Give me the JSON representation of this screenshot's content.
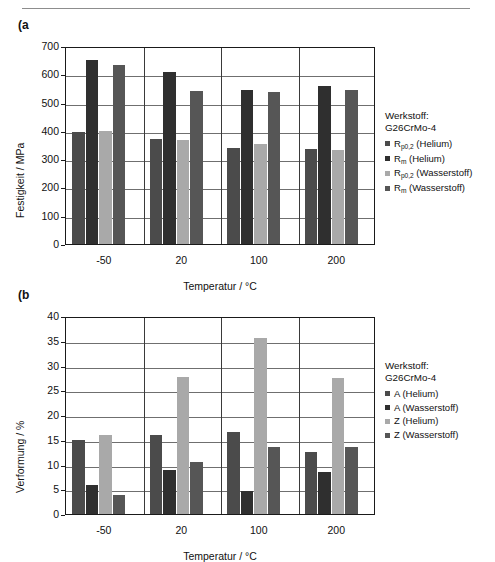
{
  "page": {
    "top_rule": true
  },
  "figures": [
    {
      "panel_label": "(a",
      "legend": {
        "title": "Werkstoff:\nG26CrMo-4",
        "entries": [
          {
            "label": "R",
            "sub": "p0,2",
            "suffix": " (Helium)",
            "color": "#4b4b4b"
          },
          {
            "label": "R",
            "sub": "m",
            "suffix": " (Helium)",
            "color": "#2f2f2f"
          },
          {
            "label": "R",
            "sub": "p0,2",
            "suffix": " (Wasserstoff)",
            "color": "#a9a9a9"
          },
          {
            "label": "R",
            "sub": "m",
            "suffix": " (Wasserstoff)",
            "color": "#565656"
          }
        ]
      },
      "chart_data": {
        "type": "bar",
        "title": "",
        "xlabel": "Temperatur  /  °C",
        "ylabel": "Festigkeit  /  MPa",
        "categories": [
          "-50",
          "20",
          "100",
          "200"
        ],
        "ylim": [
          0,
          700
        ],
        "yticks": [
          0,
          100,
          200,
          300,
          400,
          500,
          600,
          700
        ],
        "grid": true,
        "legend_position": "right",
        "series": [
          {
            "name": "Rp0,2 (Helium)",
            "color": "#4b4b4b",
            "values": [
              395,
              373,
              339,
              336
            ]
          },
          {
            "name": "Rm (Helium)",
            "color": "#2f2f2f",
            "values": [
              650,
              608,
              546,
              557
            ]
          },
          {
            "name": "Rp0,2 (Wasserstoff)",
            "color": "#a9a9a9",
            "values": [
              398,
              369,
              355,
              331
            ]
          },
          {
            "name": "Rm (Wasserstoff)",
            "color": "#565656",
            "values": [
              632,
              542,
              539,
              543
            ]
          }
        ]
      }
    },
    {
      "panel_label": "(b",
      "legend": {
        "title": "Werkstoff:\nG26CrMo-4",
        "entries": [
          {
            "label": "A",
            "sub": "",
            "suffix": " (Helium)",
            "color": "#4b4b4b"
          },
          {
            "label": "A",
            "sub": "",
            "suffix": " (Wasserstoff)",
            "color": "#2f2f2f"
          },
          {
            "label": "Z",
            "sub": "",
            "suffix": " (Helium)",
            "color": "#a9a9a9"
          },
          {
            "label": "Z",
            "sub": "",
            "suffix": " (Wasserstoff)",
            "color": "#565656"
          }
        ]
      },
      "chart_data": {
        "type": "bar",
        "title": "",
        "xlabel": "Temperatur  /  °C",
        "ylabel": "Verformung  /  %",
        "categories": [
          "-50",
          "20",
          "100",
          "200"
        ],
        "ylim": [
          0,
          40
        ],
        "yticks": [
          0,
          5,
          10,
          15,
          20,
          25,
          30,
          35,
          40
        ],
        "grid": true,
        "legend_position": "right",
        "series": [
          {
            "name": "A (Helium)",
            "color": "#4b4b4b",
            "values": [
              15.0,
              15.9,
              16.6,
              12.6
            ]
          },
          {
            "name": "A (Wasserstoff)",
            "color": "#2f2f2f",
            "values": [
              5.8,
              8.8,
              4.7,
              8.5
            ]
          },
          {
            "name": "Z (Helium)",
            "color": "#a9a9a9",
            "values": [
              15.9,
              27.7,
              35.6,
              27.5
            ]
          },
          {
            "name": "Z (Wasserstoff)",
            "color": "#565656",
            "values": [
              3.8,
              10.6,
              13.6,
              13.6
            ]
          }
        ]
      }
    }
  ]
}
